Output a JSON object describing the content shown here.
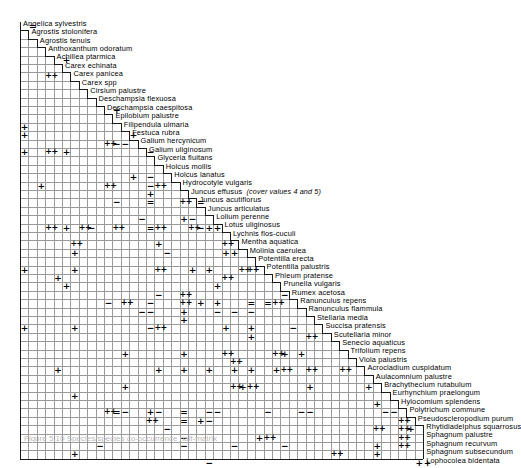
{
  "figure": {
    "caption": "Figure 5.10  Species/species co-occurrence half-matrix",
    "annotation": "(cover values 4 and 5)",
    "annotation_owner": "Juncus effusus",
    "symbol_legend": {
      "plus": "+",
      "double_plus": "++",
      "minus": "−",
      "double_minus": "="
    },
    "colors": {
      "grid": "#9a9a9a",
      "edge": "#1a1a1a",
      "symbol": "#000000",
      "background": "#ffffff"
    },
    "grid": {
      "rows": 48,
      "cols": 48,
      "cell": 8.4,
      "origin_x": 20,
      "origin_y": 22
    }
  },
  "species": [
    "Angelica sylvestris",
    "Agrostis stolonifera",
    "Agrostis tenuis",
    "Anthoxanthum odoratum",
    "Achillea ptarmica",
    "Carex echinata",
    "Carex panicea",
    "Carex spp",
    "Cirsium palustre",
    "Deschampsia flexuosa",
    "Deschampsia caespitosa",
    "Epilobium palustre",
    "Filipendula ulmaria",
    "Festuca rubra",
    "Galium hercynicum",
    "Galium uliginosum",
    "Glyceria fluitans",
    "Holcus mollis",
    "Holcus lanatus",
    "Hydrocotyle vulgaris",
    "Juncus effusus",
    "Juncus acutiflorus",
    "Juncus articulatus",
    "Lolium perenne",
    "Lotus uliginosus",
    "Lychnis flos-cuculi",
    "Mentha aquatica",
    "Molinia caerulea",
    "Potentilla erecta",
    "Potentilla palustris",
    "Phleum pratense",
    "Prunella vulgaris",
    "Rumex acetosa",
    "Ranunculus repens",
    "Ranunculus flammula",
    "Stellaria media",
    "Succisa pratensis",
    "Scutellaria minor",
    "Senecio aquaticus",
    "Trifolium repens",
    "Viola palustris",
    "Acrocladium cuspidatum",
    "Aulacomnium palustre",
    "Brachythecium rutabulum",
    "Eurhynchium praelongum",
    "Hylocomium splendens",
    "Polytrichum commune",
    "Pseudoscleropodium purum",
    "Rhytidiadelphus squarrosus",
    "Sphagnum palustre",
    "Sphagnum recurvum",
    "Sphagnum subsecundum",
    "Lophocolea bidentata"
  ],
  "cells": [
    {
      "r": 1,
      "c": 1,
      "v": "="
    },
    {
      "r": 5,
      "c": 5,
      "v": "+"
    },
    {
      "r": 7,
      "c": 3,
      "v": "++"
    },
    {
      "r": 11,
      "c": 11,
      "v": "+"
    },
    {
      "r": 13,
      "c": 0,
      "v": "+"
    },
    {
      "r": 14,
      "c": 0,
      "v": "+"
    },
    {
      "r": 14,
      "c": 13,
      "v": "+"
    },
    {
      "r": 15,
      "c": 10,
      "v": "++"
    },
    {
      "r": 15,
      "c": 11,
      "v": "−"
    },
    {
      "r": 15,
      "c": 12,
      "v": "−"
    },
    {
      "r": 16,
      "c": 0,
      "v": "+"
    },
    {
      "r": 16,
      "c": 3,
      "v": "++"
    },
    {
      "r": 16,
      "c": 5,
      "v": "+"
    },
    {
      "r": 16,
      "c": 15,
      "v": "−"
    },
    {
      "r": 19,
      "c": 13,
      "v": "+"
    },
    {
      "r": 19,
      "c": 15,
      "v": "−"
    },
    {
      "r": 20,
      "c": 2,
      "v": "+"
    },
    {
      "r": 20,
      "c": 10,
      "v": "++"
    },
    {
      "r": 20,
      "c": 15,
      "v": "−"
    },
    {
      "r": 20,
      "c": 16,
      "v": "++"
    },
    {
      "r": 21,
      "c": 15,
      "v": "+"
    },
    {
      "r": 22,
      "c": 11,
      "v": "−"
    },
    {
      "r": 22,
      "c": 15,
      "v": "="
    },
    {
      "r": 22,
      "c": 19,
      "v": "++"
    },
    {
      "r": 22,
      "c": 21,
      "v": "="
    },
    {
      "r": 24,
      "c": 14,
      "v": "−"
    },
    {
      "r": 24,
      "c": 19,
      "v": "+"
    },
    {
      "r": 24,
      "c": 20,
      "v": "−"
    },
    {
      "r": 25,
      "c": 3,
      "v": "++"
    },
    {
      "r": 25,
      "c": 5,
      "v": "+"
    },
    {
      "r": 25,
      "c": 7,
      "v": "++"
    },
    {
      "r": 25,
      "c": 8,
      "v": "−"
    },
    {
      "r": 25,
      "c": 11,
      "v": "++"
    },
    {
      "r": 25,
      "c": 15,
      "v": "="
    },
    {
      "r": 25,
      "c": 16,
      "v": "++"
    },
    {
      "r": 25,
      "c": 20,
      "v": "++"
    },
    {
      "r": 25,
      "c": 21,
      "v": "−"
    },
    {
      "r": 25,
      "c": 22,
      "v": "+"
    },
    {
      "r": 25,
      "c": 23,
      "v": "+"
    },
    {
      "r": 27,
      "c": 6,
      "v": "++"
    },
    {
      "r": 27,
      "c": 16,
      "v": "+"
    },
    {
      "r": 27,
      "c": 24,
      "v": "++"
    },
    {
      "r": 28,
      "c": 6,
      "v": "+"
    },
    {
      "r": 28,
      "c": 17,
      "v": "−"
    },
    {
      "r": 28,
      "c": 24,
      "v": "+"
    },
    {
      "r": 28,
      "c": 25,
      "v": "+"
    },
    {
      "r": 30,
      "c": 0,
      "v": "+"
    },
    {
      "r": 30,
      "c": 6,
      "v": "+"
    },
    {
      "r": 30,
      "c": 16,
      "v": "++"
    },
    {
      "r": 30,
      "c": 20,
      "v": "+"
    },
    {
      "r": 30,
      "c": 22,
      "v": "+"
    },
    {
      "r": 30,
      "c": 26,
      "v": "++"
    },
    {
      "r": 30,
      "c": 27,
      "v": "++"
    },
    {
      "r": 31,
      "c": 4,
      "v": "+"
    },
    {
      "r": 31,
      "c": 24,
      "v": "++"
    },
    {
      "r": 32,
      "c": 5,
      "v": "+"
    },
    {
      "r": 32,
      "c": 23,
      "v": "+"
    },
    {
      "r": 33,
      "c": 16,
      "v": "−"
    },
    {
      "r": 33,
      "c": 19,
      "v": "++"
    },
    {
      "r": 33,
      "c": 31,
      "v": "−"
    },
    {
      "r": 34,
      "c": 10,
      "v": "−"
    },
    {
      "r": 34,
      "c": 12,
      "v": "++"
    },
    {
      "r": 34,
      "c": 15,
      "v": "−"
    },
    {
      "r": 34,
      "c": 19,
      "v": "++"
    },
    {
      "r": 34,
      "c": 21,
      "v": "+"
    },
    {
      "r": 34,
      "c": 23,
      "v": "+"
    },
    {
      "r": 34,
      "c": 27,
      "v": "="
    },
    {
      "r": 34,
      "c": 29,
      "v": "="
    },
    {
      "r": 34,
      "c": 30,
      "v": "++"
    },
    {
      "r": 35,
      "c": 14,
      "v": "−"
    },
    {
      "r": 35,
      "c": 15,
      "v": "−"
    },
    {
      "r": 35,
      "c": 19,
      "v": "+"
    },
    {
      "r": 35,
      "c": 23,
      "v": "−"
    },
    {
      "r": 35,
      "c": 25,
      "v": "−"
    },
    {
      "r": 35,
      "c": 27,
      "v": "−"
    },
    {
      "r": 36,
      "c": 19,
      "v": "+"
    },
    {
      "r": 37,
      "c": 0,
      "v": "+"
    },
    {
      "r": 37,
      "c": 6,
      "v": "+"
    },
    {
      "r": 37,
      "c": 15,
      "v": "−"
    },
    {
      "r": 37,
      "c": 16,
      "v": "++"
    },
    {
      "r": 37,
      "c": 24,
      "v": "+"
    },
    {
      "r": 37,
      "c": 27,
      "v": "+"
    },
    {
      "r": 37,
      "c": 32,
      "v": "−"
    },
    {
      "r": 38,
      "c": 27,
      "v": "+"
    },
    {
      "r": 38,
      "c": 34,
      "v": "++"
    },
    {
      "r": 40,
      "c": 12,
      "v": "+"
    },
    {
      "r": 40,
      "c": 19,
      "v": "+"
    },
    {
      "r": 40,
      "c": 24,
      "v": "++"
    },
    {
      "r": 40,
      "c": 30,
      "v": "++"
    },
    {
      "r": 40,
      "c": 31,
      "v": "+"
    },
    {
      "r": 40,
      "c": 33,
      "v": "+"
    },
    {
      "r": 41,
      "c": 25,
      "v": "++"
    },
    {
      "r": 42,
      "c": 4,
      "v": "+"
    },
    {
      "r": 42,
      "c": 16,
      "v": "+"
    },
    {
      "r": 42,
      "c": 19,
      "v": "+"
    },
    {
      "r": 42,
      "c": 22,
      "v": "+"
    },
    {
      "r": 42,
      "c": 25,
      "v": "+"
    },
    {
      "r": 42,
      "c": 27,
      "v": "+"
    },
    {
      "r": 42,
      "c": 30,
      "v": "+"
    },
    {
      "r": 42,
      "c": 31,
      "v": "++"
    },
    {
      "r": 42,
      "c": 34,
      "v": "++"
    },
    {
      "r": 42,
      "c": 38,
      "v": "++"
    },
    {
      "r": 44,
      "c": 12,
      "v": "+"
    },
    {
      "r": 44,
      "c": 25,
      "v": "++"
    },
    {
      "r": 44,
      "c": 26,
      "v": "+"
    },
    {
      "r": 44,
      "c": 27,
      "v": "++"
    },
    {
      "r": 44,
      "c": 34,
      "v": "+"
    },
    {
      "r": 44,
      "c": 41,
      "v": "+"
    },
    {
      "r": 45,
      "c": 6,
      "v": "+"
    },
    {
      "r": 46,
      "c": 42,
      "v": "+"
    },
    {
      "r": 47,
      "c": 10,
      "v": "++"
    },
    {
      "r": 47,
      "c": 11,
      "v": "="
    },
    {
      "r": 47,
      "c": 12,
      "v": "−"
    },
    {
      "r": 47,
      "c": 15,
      "v": "+"
    },
    {
      "r": 47,
      "c": 16,
      "v": "−"
    },
    {
      "r": 47,
      "c": 19,
      "v": "="
    },
    {
      "r": 47,
      "c": 22,
      "v": "−"
    },
    {
      "r": 47,
      "c": 23,
      "v": "−"
    },
    {
      "r": 47,
      "c": 29,
      "v": "−"
    },
    {
      "r": 47,
      "c": 33,
      "v": "−"
    },
    {
      "r": 47,
      "c": 34,
      "v": "−"
    },
    {
      "r": 47,
      "c": 43,
      "v": "−"
    },
    {
      "r": 47,
      "c": 44,
      "v": "−"
    },
    {
      "r": 48,
      "c": 15,
      "v": "++"
    },
    {
      "r": 48,
      "c": 19,
      "v": "="
    },
    {
      "r": 48,
      "c": 21,
      "v": "+"
    },
    {
      "r": 48,
      "c": 22,
      "v": "−"
    },
    {
      "r": 48,
      "c": 45,
      "v": "++"
    },
    {
      "r": 49,
      "c": 17,
      "v": "−"
    },
    {
      "r": 49,
      "c": 42,
      "v": "++"
    },
    {
      "r": 49,
      "c": 45,
      "v": "++"
    },
    {
      "r": 49,
      "c": 46,
      "v": "+"
    },
    {
      "r": 50,
      "c": 19,
      "v": "−"
    },
    {
      "r": 50,
      "c": 28,
      "v": "+"
    },
    {
      "r": 50,
      "c": 29,
      "v": "++"
    },
    {
      "r": 50,
      "c": 45,
      "v": "++"
    },
    {
      "r": 51,
      "c": 9,
      "v": "−"
    },
    {
      "r": 51,
      "c": 19,
      "v": "−"
    },
    {
      "r": 51,
      "c": 25,
      "v": "−"
    },
    {
      "r": 51,
      "c": 31,
      "v": "−"
    },
    {
      "r": 51,
      "c": 42,
      "v": "+"
    },
    {
      "r": 51,
      "c": 45,
      "v": "++"
    },
    {
      "r": 52,
      "c": 6,
      "v": "+"
    },
    {
      "r": 52,
      "c": 37,
      "v": "++"
    },
    {
      "r": 52,
      "c": 42,
      "v": "+"
    },
    {
      "r": 53,
      "c": 22,
      "v": "−"
    },
    {
      "r": 53,
      "c": 47,
      "v": "+"
    },
    {
      "r": 53,
      "c": 48,
      "v": "+"
    }
  ]
}
